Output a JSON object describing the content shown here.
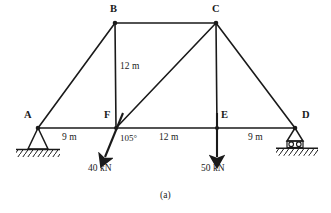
{
  "figure": {
    "caption": "(a)",
    "type": "truss-free-body-diagram"
  },
  "nodes": [
    {
      "id": "A",
      "label": "A",
      "x": 38,
      "y": 128,
      "label_x": 24,
      "label_y": 112
    },
    {
      "id": "B",
      "label": "B",
      "x": 115,
      "y": 23,
      "label_x": 110,
      "label_y": 5
    },
    {
      "id": "C",
      "label": "C",
      "x": 216,
      "y": 23,
      "label_x": 212,
      "label_y": 5
    },
    {
      "id": "D",
      "label": "D",
      "x": 295,
      "y": 128,
      "label_x": 302,
      "label_y": 112
    },
    {
      "id": "E",
      "label": "E",
      "x": 217,
      "y": 128,
      "label_x": 221,
      "label_y": 112
    },
    {
      "id": "F",
      "label": "F",
      "x": 116,
      "y": 128,
      "label_x": 104,
      "label_y": 112
    }
  ],
  "members": [
    {
      "name": "member-A-B",
      "from": "A",
      "to": "B"
    },
    {
      "name": "member-B-C",
      "from": "B",
      "to": "C"
    },
    {
      "name": "member-C-D",
      "from": "C",
      "to": "D"
    },
    {
      "name": "member-B-F",
      "from": "B",
      "to": "F"
    },
    {
      "name": "member-C-E",
      "from": "C",
      "to": "E"
    },
    {
      "name": "member-F-C",
      "from": "F",
      "to": "C"
    },
    {
      "name": "member-A-F",
      "from": "A",
      "to": "F"
    },
    {
      "name": "member-F-E",
      "from": "F",
      "to": "E"
    },
    {
      "name": "member-E-D",
      "from": "E",
      "to": "D"
    }
  ],
  "dimensions": [
    {
      "name": "dimension-A-F",
      "value": "9 m",
      "x": 62,
      "y": 133
    },
    {
      "name": "dimension-B-F-height",
      "value": "12 m",
      "x": 120,
      "y": 60
    },
    {
      "name": "dimension-F-E",
      "value": "12 m",
      "x": 160,
      "y": 133
    },
    {
      "name": "dimension-E-D",
      "value": "9 m",
      "x": 248,
      "y": 133
    }
  ],
  "angles": [
    {
      "name": "angle-at-F",
      "value": "105°",
      "x": 123,
      "y": 134
    }
  ],
  "loads": [
    {
      "name": "load-40kn",
      "label": "40 kN",
      "magnitude": 40,
      "unit": "kN",
      "at_node": "F",
      "direction": "inclined",
      "label_x": 92,
      "label_y": 166,
      "tip_x": 104,
      "tip_y": 160
    },
    {
      "name": "load-50kn",
      "label": "50 kN",
      "magnitude": 50,
      "unit": "kN",
      "at_node": "E",
      "direction": "vertical-down",
      "label_x": 203,
      "label_y": 166,
      "tip_x": 217,
      "tip_y": 160
    }
  ],
  "supports": [
    {
      "name": "support-pin-A",
      "type": "pin",
      "at_node": "A"
    },
    {
      "name": "support-roller-D",
      "type": "roller",
      "at_node": "D"
    }
  ],
  "colors": {
    "line": "#1a1a1a",
    "background": "#ffffff",
    "text": "#1a1a1a"
  }
}
